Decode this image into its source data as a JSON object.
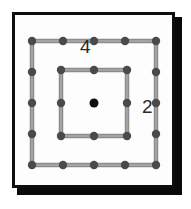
{
  "figure": {
    "name": "concentric-square-lattice",
    "background_color": "#ffffff",
    "panel": {
      "fill_color": "#fdfdfd",
      "border_color": "#0e0e0e",
      "shadow_color": "#0a0a0a"
    },
    "labels": [
      {
        "id": "outer-square-label",
        "text": "4",
        "x": 88,
        "y": 47
      },
      {
        "id": "inner-square-label",
        "text": "2",
        "x": 148,
        "y": 107
      }
    ],
    "colors": {
      "edge": "#8c8c8c",
      "edge_highlight": "#b3b3b3",
      "node": "#4a4a4a",
      "center_node": "#101010"
    },
    "squares": [
      {
        "id": "outer-square",
        "label": "4",
        "segments_per_side": 4,
        "nodes_per_side": 5,
        "center": {
          "x": 94,
          "y": 103
        },
        "half_size": 62,
        "edge_color": "#8c8c8c",
        "node_color": "#4a4a4a"
      },
      {
        "id": "inner-square",
        "label": "2",
        "segments_per_side": 2,
        "nodes_per_side": 3,
        "center": {
          "x": 94,
          "y": 103
        },
        "half_size": 33,
        "edge_color": "#8c8c8c",
        "node_color": "#4a4a4a"
      }
    ],
    "center_point": {
      "id": "center-node",
      "x": 94,
      "y": 103,
      "radius": 4.5,
      "color": "#101010"
    },
    "node_radius": 4.2,
    "edge_width": 4.5
  }
}
